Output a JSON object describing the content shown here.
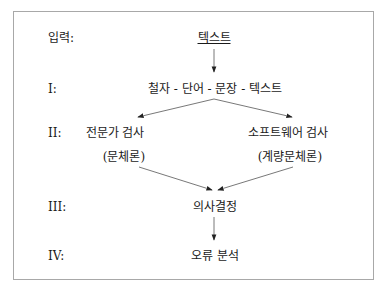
{
  "diagram": {
    "levels": [
      {
        "label": "입력:",
        "nodes": [
          "텍스트"
        ]
      },
      {
        "label": "I:",
        "nodes": [
          "철자 - 단어 - 문장 - 텍스트"
        ]
      },
      {
        "label": "II:",
        "nodes": [
          "전문가 검사",
          "소프트웨어 검사"
        ],
        "subnodes": [
          "(문체론)",
          "(계량문체론)"
        ]
      },
      {
        "label": "III:",
        "nodes": [
          "의사결정"
        ]
      },
      {
        "label": "IV:",
        "nodes": [
          "오류 분석"
        ]
      }
    ],
    "edges": [
      [
        "텍스트",
        "철자 - 단어 - 문장 - 텍스트"
      ],
      [
        "철자 - 단어 - 문장 - 텍스트",
        "전문가 검사"
      ],
      [
        "철자 - 단어 - 문장 - 텍스트",
        "소프트웨어 검사"
      ],
      [
        "(문체론)",
        "의사결정"
      ],
      [
        "(계량문체론)",
        "의사결정"
      ],
      [
        "의사결정",
        "오류 분석"
      ]
    ],
    "colors": {
      "border": "#a8a8a8",
      "line": "#555555",
      "text": "#1a1a1a"
    }
  }
}
